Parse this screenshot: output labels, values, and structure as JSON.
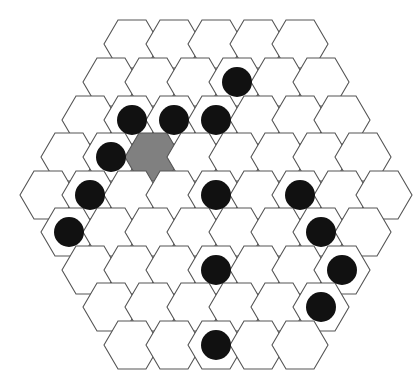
{
  "board": {
    "title": "Hexagonal board",
    "shape": "hexagon-of-hexagons",
    "orientation": "flat-top",
    "side_length": 5,
    "total_cells": 61,
    "rows_cell_counts": [
      5,
      6,
      7,
      8,
      9,
      8,
      7,
      6,
      5
    ],
    "colors": {
      "background": "#ffffff",
      "cell_fill": "#ffffff",
      "cell_stroke": "#555555",
      "piece_black": "#111111",
      "highlight_gray": "#808080"
    },
    "geometry": {
      "hex_width": 56,
      "hex_height": 48,
      "col_step": 42,
      "row_step": 37.5,
      "origin_x": 20,
      "origin_y": 20,
      "piece_radius": 15
    },
    "cells": [
      {
        "row": 0,
        "col": 0,
        "cx": 132,
        "cy": 44,
        "state": "empty"
      },
      {
        "row": 0,
        "col": 1,
        "cx": 174,
        "cy": 44,
        "state": "empty"
      },
      {
        "row": 0,
        "col": 2,
        "cx": 216,
        "cy": 44,
        "state": "empty"
      },
      {
        "row": 0,
        "col": 3,
        "cx": 258,
        "cy": 44,
        "state": "empty"
      },
      {
        "row": 0,
        "col": 4,
        "cx": 300,
        "cy": 44,
        "state": "empty"
      },
      {
        "row": 1,
        "col": 0,
        "cx": 111,
        "cy": 82,
        "state": "empty"
      },
      {
        "row": 1,
        "col": 1,
        "cx": 153,
        "cy": 82,
        "state": "empty"
      },
      {
        "row": 1,
        "col": 2,
        "cx": 195,
        "cy": 82,
        "state": "empty"
      },
      {
        "row": 1,
        "col": 3,
        "cx": 237,
        "cy": 82,
        "state": "black"
      },
      {
        "row": 1,
        "col": 4,
        "cx": 279,
        "cy": 82,
        "state": "empty"
      },
      {
        "row": 1,
        "col": 5,
        "cx": 321,
        "cy": 82,
        "state": "empty"
      },
      {
        "row": 2,
        "col": 0,
        "cx": 90,
        "cy": 120,
        "state": "empty"
      },
      {
        "row": 2,
        "col": 1,
        "cx": 132,
        "cy": 120,
        "state": "black"
      },
      {
        "row": 2,
        "col": 2,
        "cx": 174,
        "cy": 120,
        "state": "black"
      },
      {
        "row": 2,
        "col": 3,
        "cx": 216,
        "cy": 120,
        "state": "black"
      },
      {
        "row": 2,
        "col": 4,
        "cx": 258,
        "cy": 120,
        "state": "empty"
      },
      {
        "row": 2,
        "col": 5,
        "cx": 300,
        "cy": 120,
        "state": "empty"
      },
      {
        "row": 2,
        "col": 6,
        "cx": 342,
        "cy": 120,
        "state": "empty"
      },
      {
        "row": 3,
        "col": 0,
        "cx": 69,
        "cy": 157,
        "state": "empty"
      },
      {
        "row": 3,
        "col": 1,
        "cx": 111,
        "cy": 157,
        "state": "black"
      },
      {
        "row": 3,
        "col": 2,
        "cx": 153,
        "cy": 157,
        "state": "highlight"
      },
      {
        "row": 3,
        "col": 3,
        "cx": 195,
        "cy": 157,
        "state": "empty"
      },
      {
        "row": 3,
        "col": 4,
        "cx": 237,
        "cy": 157,
        "state": "empty"
      },
      {
        "row": 3,
        "col": 5,
        "cx": 279,
        "cy": 157,
        "state": "empty"
      },
      {
        "row": 3,
        "col": 6,
        "cx": 321,
        "cy": 157,
        "state": "empty"
      },
      {
        "row": 3,
        "col": 7,
        "cx": 363,
        "cy": 157,
        "state": "empty"
      },
      {
        "row": 4,
        "col": 0,
        "cx": 48,
        "cy": 195,
        "state": "empty"
      },
      {
        "row": 4,
        "col": 1,
        "cx": 90,
        "cy": 195,
        "state": "black"
      },
      {
        "row": 4,
        "col": 2,
        "cx": 132,
        "cy": 195,
        "state": "empty"
      },
      {
        "row": 4,
        "col": 3,
        "cx": 174,
        "cy": 195,
        "state": "empty"
      },
      {
        "row": 4,
        "col": 4,
        "cx": 216,
        "cy": 195,
        "state": "black"
      },
      {
        "row": 4,
        "col": 5,
        "cx": 258,
        "cy": 195,
        "state": "empty"
      },
      {
        "row": 4,
        "col": 6,
        "cx": 300,
        "cy": 195,
        "state": "black"
      },
      {
        "row": 4,
        "col": 7,
        "cx": 342,
        "cy": 195,
        "state": "empty"
      },
      {
        "row": 4,
        "col": 8,
        "cx": 384,
        "cy": 195,
        "state": "empty"
      },
      {
        "row": 5,
        "col": 0,
        "cx": 69,
        "cy": 232,
        "state": "black"
      },
      {
        "row": 5,
        "col": 1,
        "cx": 111,
        "cy": 232,
        "state": "empty"
      },
      {
        "row": 5,
        "col": 2,
        "cx": 153,
        "cy": 232,
        "state": "empty"
      },
      {
        "row": 5,
        "col": 3,
        "cx": 195,
        "cy": 232,
        "state": "empty"
      },
      {
        "row": 5,
        "col": 4,
        "cx": 237,
        "cy": 232,
        "state": "empty"
      },
      {
        "row": 5,
        "col": 5,
        "cx": 279,
        "cy": 232,
        "state": "empty"
      },
      {
        "row": 5,
        "col": 6,
        "cx": 321,
        "cy": 232,
        "state": "black"
      },
      {
        "row": 5,
        "col": 7,
        "cx": 363,
        "cy": 232,
        "state": "empty"
      },
      {
        "row": 6,
        "col": 0,
        "cx": 90,
        "cy": 270,
        "state": "empty"
      },
      {
        "row": 6,
        "col": 1,
        "cx": 132,
        "cy": 270,
        "state": "empty"
      },
      {
        "row": 6,
        "col": 2,
        "cx": 174,
        "cy": 270,
        "state": "empty"
      },
      {
        "row": 6,
        "col": 3,
        "cx": 216,
        "cy": 270,
        "state": "black"
      },
      {
        "row": 6,
        "col": 4,
        "cx": 258,
        "cy": 270,
        "state": "empty"
      },
      {
        "row": 6,
        "col": 5,
        "cx": 300,
        "cy": 270,
        "state": "empty"
      },
      {
        "row": 6,
        "col": 6,
        "cx": 342,
        "cy": 270,
        "state": "black"
      },
      {
        "row": 7,
        "col": 0,
        "cx": 111,
        "cy": 307,
        "state": "empty"
      },
      {
        "row": 7,
        "col": 1,
        "cx": 153,
        "cy": 307,
        "state": "empty"
      },
      {
        "row": 7,
        "col": 2,
        "cx": 195,
        "cy": 307,
        "state": "empty"
      },
      {
        "row": 7,
        "col": 3,
        "cx": 237,
        "cy": 307,
        "state": "empty"
      },
      {
        "row": 7,
        "col": 4,
        "cx": 279,
        "cy": 307,
        "state": "empty"
      },
      {
        "row": 7,
        "col": 5,
        "cx": 321,
        "cy": 307,
        "state": "black"
      },
      {
        "row": 8,
        "col": 0,
        "cx": 132,
        "cy": 345,
        "state": "empty"
      },
      {
        "row": 8,
        "col": 1,
        "cx": 174,
        "cy": 345,
        "state": "empty"
      },
      {
        "row": 8,
        "col": 2,
        "cx": 216,
        "cy": 345,
        "state": "black"
      },
      {
        "row": 8,
        "col": 3,
        "cx": 258,
        "cy": 345,
        "state": "empty"
      },
      {
        "row": 8,
        "col": 4,
        "cx": 300,
        "cy": 345,
        "state": "empty"
      }
    ],
    "summary": {
      "black_piece_count": 14,
      "highlight_count": 1,
      "empty_count": 46
    }
  }
}
